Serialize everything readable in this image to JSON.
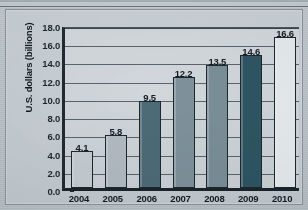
{
  "chart_data": {
    "type": "bar",
    "title": "",
    "subtitle": "",
    "xlabel": "",
    "ylabel": "U.S. dollars (billions)",
    "categories": [
      "2004",
      "2005",
      "2006",
      "2007",
      "2008",
      "2009",
      "2010"
    ],
    "values": [
      4.1,
      5.8,
      9.5,
      12.2,
      13.5,
      14.6,
      16.6
    ],
    "data_labels": [
      "4.1",
      "5.8",
      "9.5",
      "12.2",
      "13.5",
      "14.6",
      "16.6"
    ],
    "ylim": [
      0.0,
      18.0
    ],
    "ytick_step": 2.0,
    "ytick_labels": [
      "0.0",
      "2.0",
      "4.0",
      "6.0",
      "8.0",
      "10.0",
      "12.0",
      "14.0",
      "16.0",
      "18.0"
    ],
    "grid": "horizontal",
    "legend": "none",
    "bar_colors": [
      "#c6ced2",
      "#b2bcc2",
      "#4d6b77",
      "#7e929c",
      "#7b8f99",
      "#2f5663",
      "#e8edef"
    ],
    "series": [
      {
        "name": "U.S. dollars (billions)",
        "values": [
          4.1,
          5.8,
          9.5,
          12.2,
          13.5,
          14.6,
          16.6
        ]
      }
    ]
  },
  "colors": {
    "background": "#c3cbd0",
    "frame_border": "#8c949a",
    "axis": "#1e272c",
    "gridline": "#5a656c",
    "text": "#141c21"
  }
}
